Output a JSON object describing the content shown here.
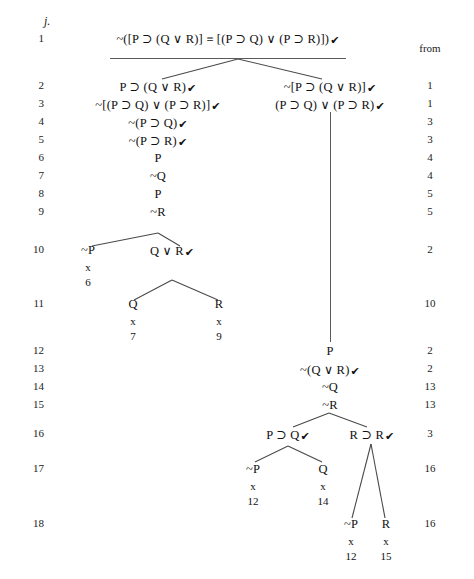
{
  "exercise": {
    "label": "j."
  },
  "columns": {
    "from_header": "from"
  },
  "line_numbers": [
    "1",
    "2",
    "3",
    "4",
    "5",
    "6",
    "7",
    "8",
    "9",
    "10",
    "11",
    "12",
    "13",
    "14",
    "15",
    "16",
    "17",
    "18"
  ],
  "from_values": {
    "r2": "1",
    "r3": "1",
    "r4": "3",
    "r5": "3",
    "r6": "4",
    "r7": "4",
    "r8": "5",
    "r9": "5",
    "r10": "2",
    "r11": "10",
    "r12": "2",
    "r13": "2",
    "r14": "13",
    "r15": "13",
    "r16": "3",
    "r17": "16",
    "r18": "16"
  },
  "check": "✔",
  "nodes": {
    "root": "~([P ⊃ (Q ∨ R)] ≡ [(P ⊃ Q) ∨ (P ⊃ R)])",
    "l2": "P ⊃ (Q ∨ R)",
    "l3": "~[(P ⊃ Q) ∨ (P ⊃ R)]",
    "l4": "~(P ⊃ Q)",
    "l5": "~(P ⊃ R)",
    "l6": "P",
    "l7": "~Q",
    "l8": "P",
    "l9": "~R",
    "l10a": "~P",
    "l10b": "Q ∨ R",
    "l11a": "Q",
    "l11b": "R",
    "r2": "~[P ⊃ (Q ∨ R)]",
    "r3": "(P ⊃ Q) ∨ (P ⊃ R)",
    "r12": "P",
    "r13": "~(Q ∨ R)",
    "r14": "~Q",
    "r15": "~R",
    "r16a": "P ⊃ Q",
    "r16b": "R ⊃ R",
    "r17a": "~P",
    "r17b": "Q",
    "r18a": "~P",
    "r18b": "R"
  },
  "closures": {
    "l10a": {
      "mark": "x",
      "ref": "6"
    },
    "l11a": {
      "mark": "x",
      "ref": "7"
    },
    "l11b": {
      "mark": "x",
      "ref": "9"
    },
    "r17a": {
      "mark": "x",
      "ref": "12"
    },
    "r17b": {
      "mark": "x",
      "ref": "14"
    },
    "r18a": {
      "mark": "x",
      "ref": "12"
    },
    "r18b": {
      "mark": "x",
      "ref": "15"
    }
  }
}
